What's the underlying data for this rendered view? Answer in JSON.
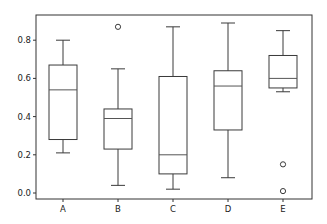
{
  "chart_data": {
    "type": "boxplot",
    "title": "",
    "xlabel": "",
    "ylabel": "",
    "categories": [
      "A",
      "B",
      "C",
      "D",
      "E"
    ],
    "yticks": [
      0.0,
      0.2,
      0.4,
      0.6,
      0.8
    ],
    "ytick_labels": [
      "0.0",
      "0.2",
      "0.4",
      "0.6",
      "0.8"
    ],
    "ylim": [
      -0.03,
      0.94
    ],
    "grid": false,
    "legend": null,
    "boxes": [
      {
        "label": "A",
        "whisker_low": 0.21,
        "q1": 0.28,
        "median": 0.54,
        "q3": 0.67,
        "whisker_high": 0.8,
        "outliers": []
      },
      {
        "label": "B",
        "whisker_low": 0.04,
        "q1": 0.23,
        "median": 0.39,
        "q3": 0.44,
        "whisker_high": 0.65,
        "outliers": [
          0.87
        ]
      },
      {
        "label": "C",
        "whisker_low": 0.02,
        "q1": 0.1,
        "median": 0.2,
        "q3": 0.61,
        "whisker_high": 0.87,
        "outliers": []
      },
      {
        "label": "D",
        "whisker_low": 0.08,
        "q1": 0.33,
        "median": 0.56,
        "q3": 0.64,
        "whisker_high": 0.89,
        "outliers": []
      },
      {
        "label": "E",
        "whisker_low": 0.53,
        "q1": 0.55,
        "median": 0.6,
        "q3": 0.72,
        "whisker_high": 0.85,
        "outliers": [
          0.15,
          0.01
        ]
      }
    ],
    "colors": {
      "line": "#3a3a3a",
      "median": "#555555",
      "axes": "#333333"
    }
  }
}
